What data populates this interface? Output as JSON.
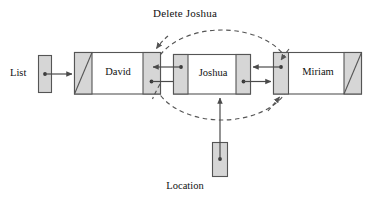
{
  "figure": {
    "title": "Delete Joshua",
    "type": "doubly-linked-list-deletion-diagram"
  },
  "labels": {
    "operation": "Delete Joshua",
    "list_handle": "List",
    "location_handle": "Location"
  },
  "nodes": [
    {
      "id": "david",
      "name": "David",
      "prev_pointer": "null",
      "next_pointer": "joshua"
    },
    {
      "id": "joshua",
      "name": "Joshua",
      "prev_pointer": "david",
      "next_pointer": "miriam"
    },
    {
      "id": "miriam",
      "name": "Miriam",
      "prev_pointer": "joshua",
      "next_pointer": "null"
    }
  ],
  "handles": [
    {
      "id": "list",
      "label": "List",
      "points_to": "david"
    },
    {
      "id": "location",
      "label": "Location",
      "points_to": "joshua"
    }
  ],
  "annotation": {
    "shape": "dashed-ellipse",
    "caption": "Delete Joshua",
    "rewire_targets": [
      "david.next",
      "miriam.prev"
    ]
  },
  "colors": {
    "pointer_field_fill": "#d6d6d6",
    "node_border": "#555555",
    "data_field_fill": "#ffffff",
    "line": "#4a4a4a",
    "dashed_line": "#555555",
    "text": "#111111",
    "background": "#ffffff"
  }
}
